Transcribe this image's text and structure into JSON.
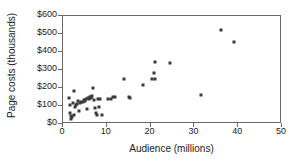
{
  "chart_data": {
    "type": "scatter",
    "title": "",
    "xlabel": "Audience (millions)",
    "ylabel": "Page costs (thousands)",
    "xlim": [
      0,
      50
    ],
    "ylim": [
      0,
      600
    ],
    "xticks": [
      0,
      10,
      20,
      30,
      40,
      50
    ],
    "yticks": [
      0,
      100,
      200,
      300,
      400,
      500,
      600
    ],
    "xtick_labels": [
      "0",
      "10",
      "20",
      "30",
      "40",
      "50"
    ],
    "ytick_labels": [
      "$0",
      "$100",
      "$200",
      "$300",
      "$400",
      "$500",
      "$600"
    ],
    "grid": false,
    "legend": null,
    "marker": {
      "shape": "square",
      "color": "#3a3a3a",
      "size_px": 3
    },
    "points": [
      {
        "x": 1.4,
        "y": 145
      },
      {
        "x": 1.6,
        "y": 108
      },
      {
        "x": 1.7,
        "y": 60
      },
      {
        "x": 1.8,
        "y": 45
      },
      {
        "x": 1.9,
        "y": 28
      },
      {
        "x": 2.1,
        "y": 38
      },
      {
        "x": 2.3,
        "y": 118
      },
      {
        "x": 2.4,
        "y": 182
      },
      {
        "x": 2.6,
        "y": 52
      },
      {
        "x": 2.8,
        "y": 95
      },
      {
        "x": 3.0,
        "y": 105
      },
      {
        "x": 3.3,
        "y": 112
      },
      {
        "x": 3.5,
        "y": 128
      },
      {
        "x": 3.7,
        "y": 75
      },
      {
        "x": 3.9,
        "y": 118
      },
      {
        "x": 4.2,
        "y": 120
      },
      {
        "x": 4.5,
        "y": 125
      },
      {
        "x": 4.7,
        "y": 132
      },
      {
        "x": 5.0,
        "y": 130
      },
      {
        "x": 5.2,
        "y": 138
      },
      {
        "x": 5.4,
        "y": 85
      },
      {
        "x": 5.6,
        "y": 142
      },
      {
        "x": 5.9,
        "y": 140
      },
      {
        "x": 6.1,
        "y": 148
      },
      {
        "x": 6.3,
        "y": 150
      },
      {
        "x": 6.5,
        "y": 145
      },
      {
        "x": 6.7,
        "y": 155
      },
      {
        "x": 6.9,
        "y": 198
      },
      {
        "x": 7.1,
        "y": 135
      },
      {
        "x": 7.3,
        "y": 90
      },
      {
        "x": 7.5,
        "y": 60
      },
      {
        "x": 7.7,
        "y": 52
      },
      {
        "x": 7.9,
        "y": 140
      },
      {
        "x": 8.2,
        "y": 92
      },
      {
        "x": 8.5,
        "y": 138
      },
      {
        "x": 8.8,
        "y": 50
      },
      {
        "x": 10.3,
        "y": 138
      },
      {
        "x": 10.9,
        "y": 140
      },
      {
        "x": 11.4,
        "y": 150
      },
      {
        "x": 11.8,
        "y": 148
      },
      {
        "x": 14.0,
        "y": 248
      },
      {
        "x": 15.0,
        "y": 150
      },
      {
        "x": 15.4,
        "y": 143
      },
      {
        "x": 18.3,
        "y": 215
      },
      {
        "x": 20.4,
        "y": 252
      },
      {
        "x": 20.7,
        "y": 285
      },
      {
        "x": 20.9,
        "y": 248
      },
      {
        "x": 21.0,
        "y": 347
      },
      {
        "x": 24.5,
        "y": 338
      },
      {
        "x": 31.5,
        "y": 162
      },
      {
        "x": 36.0,
        "y": 521
      },
      {
        "x": 39.0,
        "y": 457
      }
    ]
  }
}
